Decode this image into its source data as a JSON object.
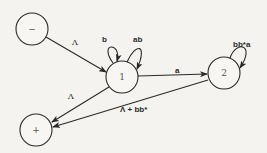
{
  "diagram": {
    "nodes": [
      {
        "id": "start",
        "label": "−",
        "cx": 32,
        "cy": 29,
        "r": 16
      },
      {
        "id": "n1",
        "label": "1",
        "cx": 122,
        "cy": 77,
        "r": 16
      },
      {
        "id": "n2",
        "label": "2",
        "cx": 224,
        "cy": 73,
        "r": 16
      },
      {
        "id": "final",
        "label": "+",
        "cx": 36,
        "cy": 130,
        "r": 16
      }
    ],
    "edges": [
      {
        "from": "start",
        "to": "n1",
        "label": "Λ"
      },
      {
        "from": "n1",
        "to": "n1",
        "label": "b"
      },
      {
        "from": "n1",
        "to": "n1",
        "label": "ab"
      },
      {
        "from": "n1",
        "to": "n2",
        "label": "a"
      },
      {
        "from": "n2",
        "to": "n2",
        "label": "bb*a"
      },
      {
        "from": "n1",
        "to": "final",
        "label": "Λ"
      },
      {
        "from": "n2",
        "to": "final",
        "label": "Λ + bb*"
      }
    ]
  }
}
